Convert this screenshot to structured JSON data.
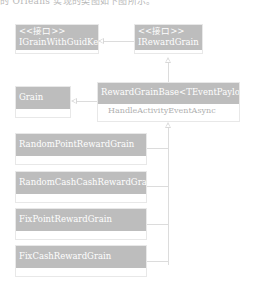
{
  "top_text": "的 Orleans 实现的类图如下图所示。",
  "colors": {
    "class_header": "#bdbdbd",
    "class_text": "#ffffff",
    "connector": "#dcdcdc",
    "member_text": "#b0b0b0"
  },
  "classes": {
    "igrain_with_guid_key": {
      "stereotype": "<<接口>>",
      "name": "IGrainWithGuidKey"
    },
    "ireward_grain": {
      "stereotype": "<<接口>>",
      "name": "IRewardGrain"
    },
    "grain": {
      "name": "Grain"
    },
    "reward_grain_base": {
      "name": "RewardGrainBase<TEventPayload>",
      "members": [
        "HandleActivityEventAsync"
      ]
    },
    "random_point_reward_grain": {
      "name": "RandomPointRewardGrain"
    },
    "random_cash_reward_grain": {
      "name": "RandomCashCashRewardGrain"
    },
    "fix_point_reward_grain": {
      "name": "FixPointRewardGrain"
    },
    "fix_cash_reward_grain": {
      "name": "FixCashRewardGrain"
    }
  },
  "relations": [
    {
      "from": "IRewardGrain",
      "to": "IGrainWithGuidKey",
      "type": "inheritance"
    },
    {
      "from": "RewardGrainBase<TEventPayload>",
      "to": "IRewardGrain",
      "type": "realization"
    },
    {
      "from": "RewardGrainBase<TEventPayload>",
      "to": "Grain",
      "type": "inheritance"
    },
    {
      "from": "RandomPointRewardGrain",
      "to": "RewardGrainBase<TEventPayload>",
      "type": "inheritance"
    },
    {
      "from": "RandomCashCashRewardGrain",
      "to": "RewardGrainBase<TEventPayload>",
      "type": "inheritance"
    },
    {
      "from": "FixPointRewardGrain",
      "to": "RewardGrainBase<TEventPayload>",
      "type": "inheritance"
    },
    {
      "from": "FixCashRewardGrain",
      "to": "RewardGrainBase<TEventPayload>",
      "type": "inheritance"
    }
  ]
}
